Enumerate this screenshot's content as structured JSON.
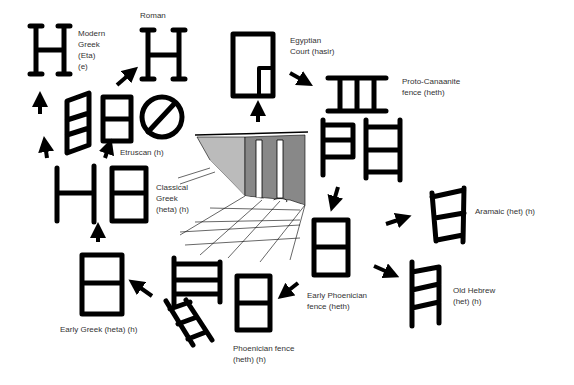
{
  "colors": {
    "ink": "#000000",
    "label": "#333333",
    "background": "#ffffff"
  },
  "labels": {
    "modern_greek": "Modern\nGreek\n(Eta)\n(e)",
    "roman": "Roman",
    "egyptian": "Egyptian\nCourt (hasir)",
    "proto_canaanite": "Proto-Canaanite\nfence (heth)",
    "etruscan": "Etruscan (h)",
    "classical_greek": "Classical\nGreek\n(heta) (h)",
    "aramaic": "Aramaic (het) (h)",
    "old_hebrew": "Old Hebrew\n(het) (h)",
    "early_greek": "Early Greek (heta) (h)",
    "early_phoenician": "Early Phoenician\nfence (heth)",
    "phoenician": "Phoenician fence\n(heth) (h)"
  },
  "nodes": [
    {
      "id": "egyptian",
      "glyph": "courtyard-plan"
    },
    {
      "id": "proto_canaanite",
      "glyph": "fence-two-bars"
    },
    {
      "id": "proto_canaanite_variants",
      "glyph": "ladder-variants"
    },
    {
      "id": "early_phoenician",
      "glyph": "box-one-bar"
    },
    {
      "id": "aramaic",
      "glyph": "ladder-open"
    },
    {
      "id": "old_hebrew",
      "glyph": "ladder-three-bars"
    },
    {
      "id": "phoenician",
      "glyph": "box-and-ladders"
    },
    {
      "id": "early_greek",
      "glyph": "box-one-bar"
    },
    {
      "id": "classical_greek",
      "glyph": "H-and-box"
    },
    {
      "id": "etruscan",
      "glyph": "slanted-box-box-circle"
    },
    {
      "id": "modern_greek",
      "glyph": "serif-H"
    },
    {
      "id": "roman",
      "glyph": "serif-H"
    }
  ],
  "illustration": "egyptian-court-with-columns"
}
